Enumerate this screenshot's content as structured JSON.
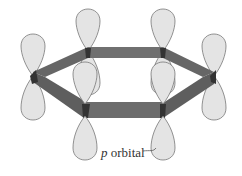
{
  "diagram": {
    "label": {
      "italic": "p",
      "text": " orbital"
    },
    "colors": {
      "lobe_fill": "#e4e4e4",
      "lobe_stroke": "#777777",
      "bond_fill": "#6a6a6a",
      "bond_dark": "#3a3a3a"
    }
  }
}
